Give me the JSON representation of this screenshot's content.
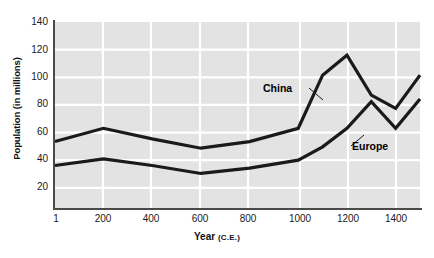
{
  "chart_data": {
    "type": "line",
    "title": "",
    "xlabel": "Year (C.E.)",
    "xlabel_main": "Year",
    "xlabel_sub": "(C.E.)",
    "ylabel": "Population (in millions)",
    "grid": true,
    "legend_position": "inline-annotation",
    "xlim": [
      1,
      1500
    ],
    "ylim": [
      0,
      140
    ],
    "xticks": [
      1,
      200,
      400,
      600,
      800,
      1000,
      1200,
      1400
    ],
    "xtick_labels": [
      "1",
      "200",
      "400",
      "600",
      "800",
      "1000",
      "1200",
      "1400"
    ],
    "yticks": [
      20,
      40,
      60,
      80,
      100,
      120,
      140
    ],
    "ytick_labels": [
      "20",
      "40",
      "60",
      "80",
      "100",
      "120",
      "140"
    ],
    "x": [
      1,
      200,
      400,
      600,
      800,
      1000,
      1100,
      1200,
      1300,
      1400,
      1500
    ],
    "series": [
      {
        "name": "China",
        "color": "#1a1a1a",
        "values": [
          50,
          60,
          52,
          45,
          50,
          60,
          100,
          115,
          85,
          75,
          100
        ]
      },
      {
        "name": "Europe",
        "color": "#1a1a1a",
        "values": [
          32,
          37,
          32,
          26,
          30,
          36,
          46,
          60,
          80,
          60,
          82
        ]
      }
    ],
    "annotations": [
      {
        "text": "China",
        "series": "China"
      },
      {
        "text": "Europe",
        "series": "Europe"
      }
    ],
    "plot_background": "#e3e3e3",
    "gridline_color": "#ffffff",
    "axis_color": "#4a4a4a"
  }
}
